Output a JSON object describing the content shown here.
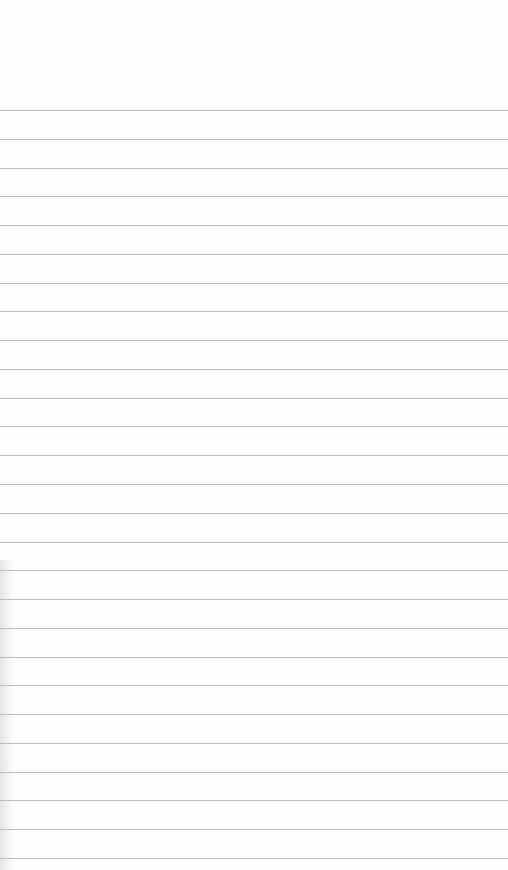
{
  "page": {
    "type": "blank ruled paper",
    "background_color": "#fefefe",
    "line_color": "#bdbdbd",
    "first_line_y": 110,
    "line_spacing": 28.77,
    "line_count": 27
  }
}
